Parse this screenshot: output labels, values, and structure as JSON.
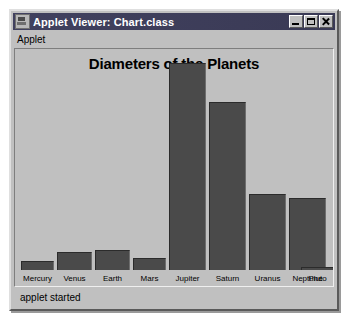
{
  "window": {
    "title": "Applet Viewer: Chart.class",
    "icon": "applet-viewer-icon",
    "controls": {
      "minimize": "minimize-icon",
      "maximize": "maximize-icon",
      "close": "close-icon"
    }
  },
  "menu": {
    "items": [
      {
        "label": "Applet"
      }
    ]
  },
  "status": {
    "text": "applet started"
  },
  "colors": {
    "window_face": "#c0c0c0",
    "title_bar": "#3c3c5c",
    "title_text": "#ffffff",
    "bar_fill": "#4a4a4a",
    "bar_outline": "#2b2b2b",
    "canvas_bg": "#c0c0c0",
    "text": "#000000"
  },
  "chart_data": {
    "type": "bar",
    "title": "Diameters of the Planets",
    "xlabel": "",
    "ylabel": "",
    "grid": false,
    "legend": "none",
    "ylim": [
      0,
      220
    ],
    "categories": [
      "Mercury",
      "Venus",
      "Earth",
      "Mars",
      "Jupiter",
      "Saturn",
      "Uranus",
      "Neptune",
      "Pluto"
    ],
    "values": [
      9,
      18,
      20,
      12,
      211,
      171,
      77,
      73,
      3
    ],
    "bars": [
      {
        "label": "Mercury",
        "value": 9,
        "x": 2,
        "width": 33
      },
      {
        "label": "Venus",
        "value": 18,
        "x": 38,
        "width": 35
      },
      {
        "label": "Earth",
        "value": 20,
        "x": 76,
        "width": 35
      },
      {
        "label": "Mars",
        "value": 12,
        "x": 114,
        "width": 33
      },
      {
        "label": "Jupiter",
        "value": 211,
        "x": 150,
        "width": 37
      },
      {
        "label": "Saturn",
        "value": 171,
        "x": 190,
        "width": 37
      },
      {
        "label": "Uranus",
        "value": 77,
        "x": 230,
        "width": 37
      },
      {
        "label": "Neptune",
        "value": 73,
        "x": 270,
        "width": 37
      },
      {
        "label": "Pluto",
        "value": 3,
        "x": 282,
        "width": 33
      }
    ]
  }
}
